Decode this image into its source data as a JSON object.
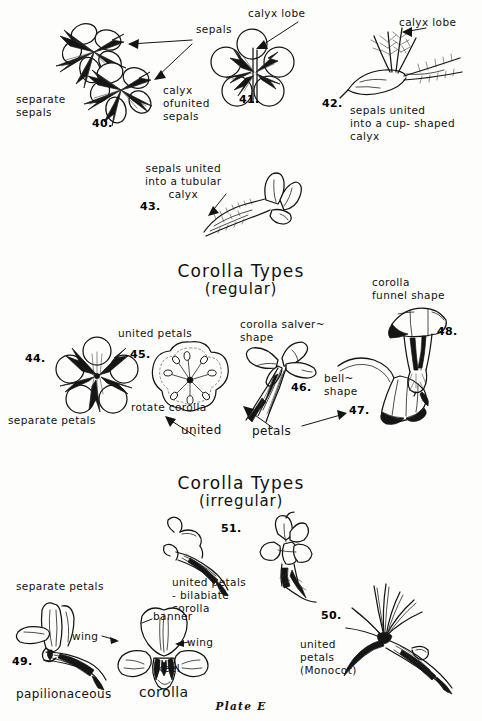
{
  "plate": {
    "footer": "Plate E",
    "background": "#fdfdfb",
    "ink": "#141414"
  },
  "headings": [
    {
      "title": "Corolla Types",
      "subtitle": "(regular)"
    },
    {
      "title": "Corolla Types",
      "subtitle": "(irregular)"
    }
  ],
  "calyx_section": {
    "labels": {
      "sepals": "sepals",
      "separate_sepals": "separate\nsepals",
      "calyx_lobe_41": "calyx lobe",
      "calyx_of_united_sepals": "calyx\nofunited\nsepals",
      "calyx_lobe_42": "calyx lobe",
      "sepals_united_cup": "sepals united\ninto a cup- shaped\ncalyx",
      "sepals_united_tubular": "sepals united\ninto a tubular\ncalyx"
    },
    "figures": [
      {
        "number": "40.",
        "caption": "separate sepals"
      },
      {
        "number": "41.",
        "caption": "calyx of united sepals"
      },
      {
        "number": "42.",
        "caption": "sepals united into a cup-shaped calyx"
      },
      {
        "number": "43.",
        "caption": "sepals united into a tubular calyx"
      }
    ]
  },
  "corolla_regular": {
    "labels": {
      "separate_petals": "separate petals",
      "united_petals_45": "united   petals",
      "rotate_corolla": "rotate corolla",
      "united": "united",
      "petals": "petals",
      "corolla_salver_shape": "corolla salver~\n      shape",
      "bell_shape": "bell~\nshape",
      "corolla_funnel_shape": "corolla\nfunnel  shape"
    },
    "figures": [
      {
        "number": "44.",
        "caption": "separate petals"
      },
      {
        "number": "45.",
        "caption": "united petals - rotate corolla"
      },
      {
        "number": "46.",
        "caption": "corolla salver-shape"
      },
      {
        "number": "47.",
        "caption": "bell-shape"
      },
      {
        "number": "48.",
        "caption": "corolla funnel shape"
      }
    ]
  },
  "corolla_irregular": {
    "labels": {
      "separate_petals": "separate petals",
      "united_petals_bilabiate": "united   petals\n  - bilabiate\n      corolla",
      "banner": "banner",
      "wing_left": "wing",
      "wing_right": "wing",
      "keel": "keel",
      "papilionaceous_corolla_left": "papilionaceous",
      "papilionaceous_corolla_right": "corolla",
      "united_petals_monocot": "united\n  petals\n  (Monocot)"
    },
    "figures": [
      {
        "number": "49.",
        "caption": "papilionaceous corolla - separate petals"
      },
      {
        "number": "50.",
        "caption": "united petals (Monocot)"
      },
      {
        "number": "51.",
        "caption": "united petals - bilabiate corolla"
      }
    ]
  }
}
